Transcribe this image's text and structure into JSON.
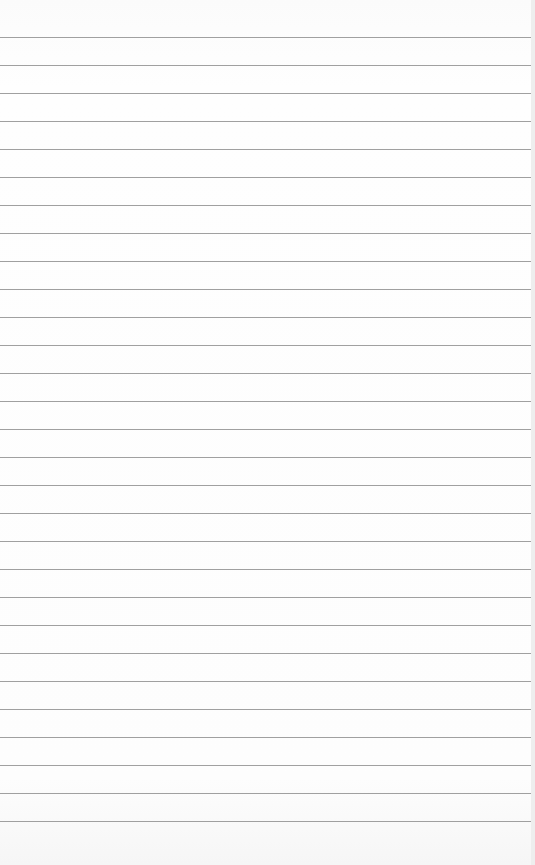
{
  "paper": {
    "type": "lined-paper",
    "line_color": "#8f8f8f",
    "background_color": "#ffffff",
    "first_line_y": 37,
    "line_spacing": 28,
    "line_count": 29
  }
}
